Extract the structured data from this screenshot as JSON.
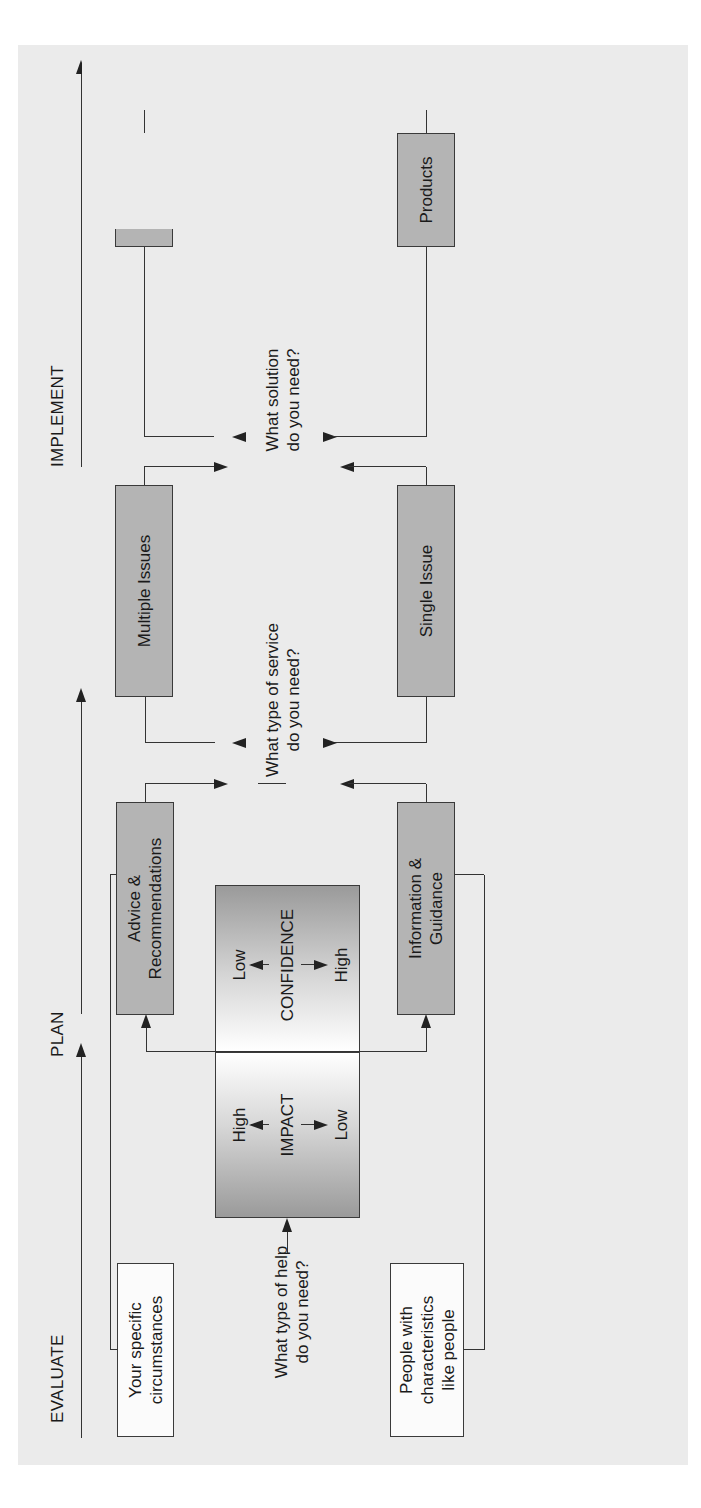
{
  "stages": {
    "evaluate": "EVALUATE",
    "plan": "PLAN",
    "implement": "IMPLEMENT"
  },
  "evaluate": {
    "top_box": "Your specific circumstances",
    "top_box_lines": [
      "Your specific",
      "circumstances"
    ],
    "bottom_box": "People with characteristics like people",
    "bottom_box_lines": [
      "People with",
      "characteristics",
      "like people"
    ],
    "question_lines": [
      "What type of help",
      "do you need?"
    ]
  },
  "matrix": {
    "impact": {
      "title": "IMPACT",
      "high": "High",
      "low": "Low"
    },
    "confidence": {
      "title": "CONFIDENCE",
      "low": "Low",
      "high": "High"
    }
  },
  "plan": {
    "top_box_lines": [
      "Advice &",
      "Recommendations"
    ],
    "bottom_box_lines": [
      "Information &",
      "Guidance"
    ],
    "question_lines": [
      "What type of service",
      "do you need?"
    ]
  },
  "issues": {
    "top_box": "Multiple Issues",
    "bottom_box": "Single Issue",
    "question_lines": [
      "What solution",
      "do you need?"
    ]
  },
  "implement": {
    "services": "Services",
    "products": "Products",
    "services_list": [
      "Legal",
      "Accounting",
      "Taxation",
      "Trust"
    ],
    "products_list": [
      "Whole of",
      "market",
      "Individual or",
      "limited number",
      "of providers"
    ]
  },
  "colors": {
    "background": "#ebebeb",
    "gray_box": "#b4b4b4",
    "white_box": "#fbfbfb",
    "line": "#333333"
  }
}
